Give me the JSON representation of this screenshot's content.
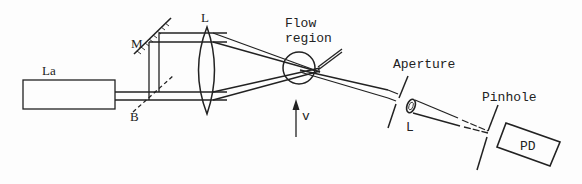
{
  "diagram": {
    "colors": {
      "line": "#222222",
      "background": "#fdfdfd"
    },
    "labels": {
      "laser": "La",
      "mirror": "M",
      "beamsplitter": "B",
      "focusing_lens": "L",
      "flow_region_line1": "Flow",
      "flow_region_line2": "region",
      "velocity": "v",
      "aperture": "Aperture",
      "collecting_lens": "L",
      "pinhole": "Pinhole",
      "photodetector": "PD"
    },
    "components": [
      {
        "id": "laser",
        "label": "La",
        "type": "rectangle"
      },
      {
        "id": "beamsplitter",
        "label": "B",
        "type": "dashed-line"
      },
      {
        "id": "mirror",
        "label": "M",
        "type": "hatched-mirror"
      },
      {
        "id": "focusing_lens",
        "label": "L",
        "type": "biconvex-lens"
      },
      {
        "id": "flow_region",
        "label": "Flow region",
        "type": "circle"
      },
      {
        "id": "velocity_arrow",
        "label": "v",
        "type": "arrow-up"
      },
      {
        "id": "aperture",
        "label": "Aperture",
        "type": "slit"
      },
      {
        "id": "collecting_lens",
        "label": "L",
        "type": "small-lens"
      },
      {
        "id": "pinhole",
        "label": "Pinhole",
        "type": "slit"
      },
      {
        "id": "photodetector",
        "label": "PD",
        "type": "rectangle"
      }
    ]
  }
}
